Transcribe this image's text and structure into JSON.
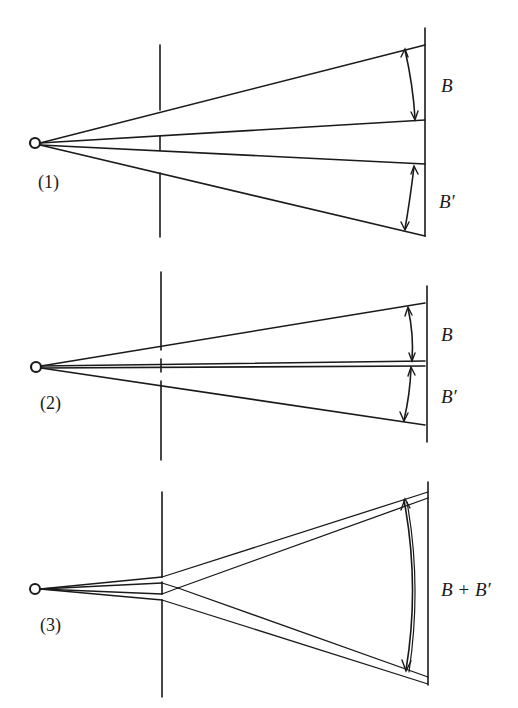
{
  "figure": {
    "panels": [
      {
        "id": "1",
        "label": "(1)",
        "screen_label_top": "B",
        "screen_label_bottom": "B′"
      },
      {
        "id": "2",
        "label": "(2)",
        "screen_label_top": "B",
        "screen_label_bottom": "B′"
      },
      {
        "id": "3",
        "label": "(3)",
        "screen_label_combined": "B + B′"
      }
    ],
    "colors": {
      "ink": "#1a1a1a",
      "background": "#ffffff"
    }
  }
}
